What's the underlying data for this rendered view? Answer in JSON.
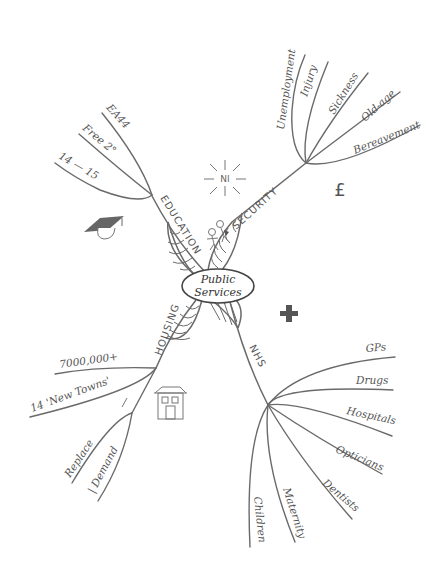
{
  "center": {
    "line1": "Public",
    "line2": "Services"
  },
  "branches": {
    "education": {
      "label": "EDUCATION",
      "leaves": [
        "EA44",
        "Free 2°",
        "14 — 15"
      ],
      "icon": "graduation-cap-icon"
    },
    "security": {
      "label": "SECURITY",
      "leaves": [
        "Unemployment",
        "Injury",
        "Sickness",
        "Old-age",
        "Bereavement"
      ],
      "icon": "pound-sign-icon",
      "icon_glyph": "£"
    },
    "housing": {
      "label": "HOUSING",
      "leaves": [
        "7000,000+",
        "14 'New Towns'",
        "Replace",
        "| Demand"
      ],
      "arrow_glyph": "/",
      "icon": "house-icon"
    },
    "nhs": {
      "label": "NHS",
      "leaves": [
        "GPs",
        "Drugs",
        "Hospitals",
        "Opticians",
        "Dentists",
        "Maternity",
        "Children"
      ],
      "icon": "plus-cross-icon",
      "icon_glyph": "+"
    }
  },
  "decorations": {
    "ni_burst": "NI",
    "people": "stick-figures-icon"
  },
  "colors": {
    "line": "#6a6a6a",
    "text": "#555555",
    "icon_dark": "#555555",
    "background": "#ffffff"
  }
}
